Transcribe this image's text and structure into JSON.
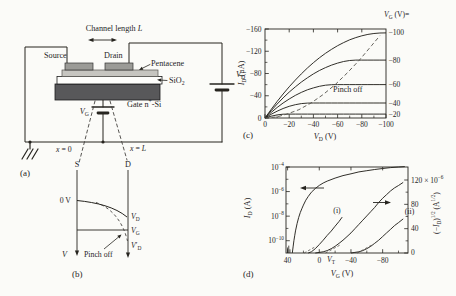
{
  "figure": {
    "background": "#fbfbf8",
    "ink": "#26241f",
    "gate_fill": "#58585a",
    "pentacene_fill": "#c6c5c0",
    "electrode_fill": "#9b9b97",
    "sio2_fill": "#fdfdfb"
  },
  "panel_a": {
    "label": "(a)",
    "channel_length": "Channel length *L*",
    "source": "Source",
    "drain": "Drain",
    "pentacene": "Pentacene",
    "sio2": "SiO_2_",
    "gate": "Gate n^+^-Si",
    "vg": "*V*_G_",
    "vd": "*V*_D_",
    "x0": "*x* = 0",
    "xl": "*x* = *L*"
  },
  "panel_b": {
    "label": "(b)",
    "s": "S",
    "d": "D",
    "zero_v": "0 V",
    "v_axis": "*V*",
    "vd": "*V*_D_",
    "vg": "*V*_G_",
    "vd_prime": "*V*′_D_",
    "pinch_off": "Pinch off"
  },
  "chart_data": [
    {
      "id": "output-characteristics",
      "type": "line",
      "panel_label": "(c)",
      "xlabel": "*V*_D_ (V)",
      "ylabel": "*I*_D_ (μA)",
      "xlim": [
        0,
        -100
      ],
      "ylim": [
        0,
        -160
      ],
      "x_ticks": [
        0,
        -20,
        -40,
        -60,
        -80,
        -100
      ],
      "y_ticks": [
        0,
        -40,
        -80,
        -120,
        -160
      ],
      "legend_header": "*V*_G_ (V)=",
      "x_start": 0,
      "x_step": -5,
      "series": [
        {
          "label": "−100",
          "vg": -100,
          "y": [
            0,
            -15.2,
            -29.7,
            -43.2,
            -56.1,
            -68.1,
            -79.3,
            -89.8,
            -99.4,
            -108.2,
            -116.3,
            -123.5,
            -130,
            -135.6,
            -140.5,
            -144.6,
            -147.8,
            -150.3,
            -152,
            -152.8,
            -153
          ]
        },
        {
          "label": "−80",
          "vg": -80,
          "y": [
            0,
            -12.9,
            -25,
            -36.2,
            -46.5,
            -55.9,
            -64.6,
            -72.3,
            -79.3,
            -85.4,
            -90.6,
            -95.1,
            -98.7,
            -101.5,
            -103.4,
            -104,
            -104,
            -104,
            -104,
            -104,
            -104
          ]
        },
        {
          "label": "−60",
          "vg": -60,
          "y": [
            0,
            -9.9,
            -18.9,
            -27,
            -34.2,
            -40.6,
            -46,
            -50.7,
            -54.2,
            -57,
            -58.9,
            -59.8,
            -60,
            -60,
            -60,
            -60,
            -60,
            -60,
            -60,
            -60,
            -60
          ]
        },
        {
          "label": "−40",
          "vg": -40,
          "y": [
            0,
            -6.6,
            -12.3,
            -17.1,
            -21,
            -23.9,
            -25.9,
            -26.8,
            -27,
            -27,
            -27,
            -27,
            -27,
            -27,
            -27,
            -27,
            -27,
            -27,
            -27,
            -27,
            -27
          ]
        },
        {
          "label": "−20",
          "vg": -20,
          "y": [
            0,
            -3.3,
            -5.6,
            -6.8,
            -7,
            -7,
            -7,
            -7,
            -7,
            -7,
            -7,
            -7,
            -7,
            -7,
            -7,
            -7,
            -7,
            -7,
            -7,
            -7,
            -7
          ]
        }
      ],
      "pinch_off": {
        "label": "Pinch off",
        "x": [
          0,
          -10,
          -18,
          -28,
          -38,
          -48,
          -58,
          -68,
          -78,
          -88,
          -95
        ],
        "y": [
          0,
          -2,
          -7,
          -15,
          -27,
          -42,
          -60,
          -81,
          -104,
          -130,
          -148
        ]
      }
    },
    {
      "id": "transfer-characteristics",
      "type": "line",
      "panel_label": "(d)",
      "xlabel": "*V*_G_ (V)",
      "xlim": [
        42,
        -112
      ],
      "x_ticks": [
        40,
        0,
        -40,
        -80
      ],
      "x_minor_ticks": [
        20,
        -20,
        -60,
        -100
      ],
      "vt_label": "*V*_T_",
      "left_axis": {
        "label": "*I*_D_ (A)",
        "tick_labels": [
          "10^−4^",
          "10^−6^",
          "10^−8^",
          "10^−10^"
        ],
        "tick_exponents": [
          -4,
          -6,
          -8,
          -10
        ],
        "minor_exponents": [
          -5,
          -7,
          -9
        ],
        "log_ylim": [
          -4,
          -11
        ]
      },
      "right_axis": {
        "label": "(−*I*_D_)^1/2^ (A^1/2^)",
        "tick_labels": [
          "120 × 10^−6^",
          "80",
          "40",
          "0"
        ],
        "tick_values": [
          120,
          80,
          40,
          0
        ],
        "minor_values": [
          20,
          60,
          100
        ],
        "ylim": [
          0,
          140
        ]
      },
      "log_series": {
        "x": [
          34,
          33,
          32,
          31,
          30,
          28,
          26,
          24,
          22,
          20,
          17,
          14,
          10,
          5,
          0,
          -5,
          -10,
          -20,
          -30,
          -40,
          -50,
          -60,
          -70,
          -80,
          -90,
          -100,
          -108
        ],
        "log10_id": [
          -11,
          -10.5,
          -10,
          -9.6,
          -9.2,
          -8.6,
          -8.1,
          -7.7,
          -7.4,
          -7.1,
          -6.7,
          -6.4,
          -6.05,
          -5.75,
          -5.5,
          -5.3,
          -5.15,
          -4.9,
          -4.7,
          -4.55,
          -4.4,
          -4.3,
          -4.2,
          -4.12,
          -4.05,
          -4,
          -3.97
        ]
      },
      "sqrt_series": [
        {
          "label": "(i)",
          "x": [
            14,
            10,
            5,
            0,
            -5,
            -10,
            -15,
            -20,
            -25,
            -29
          ],
          "sqrt_id_e6": [
            0,
            2,
            7,
            14,
            21,
            29,
            36,
            44,
            52,
            59
          ]
        },
        {
          "label": "",
          "x": [
            5,
            0,
            -5,
            -10,
            -15,
            -20,
            -25,
            -30,
            -35,
            -40,
            -45,
            -50,
            -55,
            -60,
            -65,
            -70,
            -75,
            -80,
            -85,
            -90,
            -95,
            -100,
            -106
          ],
          "sqrt_id_e6": [
            0,
            1,
            2,
            4,
            7,
            11,
            16,
            21,
            27,
            33,
            40,
            47,
            54,
            61,
            68,
            75,
            83,
            90,
            96,
            102,
            107,
            111,
            116
          ]
        },
        {
          "label": "(ii)",
          "x": [
            -40,
            -45,
            -50,
            -55,
            -60,
            -65,
            -70,
            -75,
            -80,
            -85,
            -90,
            -95,
            -100,
            -106
          ],
          "sqrt_id_e6": [
            0,
            1,
            2,
            4,
            7,
            11,
            16,
            21,
            27,
            33,
            39,
            45,
            50,
            56
          ]
        }
      ],
      "threshold_guides": [
        {
          "x": [
            19,
            4
          ],
          "sqrt_id_e6": [
            0,
            11
          ]
        },
        {
          "x": [
            -8,
            -26
          ],
          "sqrt_id_e6": [
            0,
            13
          ]
        },
        {
          "x": [
            -48,
            -66
          ],
          "sqrt_id_e6": [
            0,
            13
          ]
        }
      ],
      "noise_spikes": [
        {
          "x": 40,
          "top_exp": -10.55
        },
        {
          "x": 38.5,
          "top_exp": -10.4
        },
        {
          "x": 37,
          "top_exp": -10.7
        }
      ]
    }
  ]
}
